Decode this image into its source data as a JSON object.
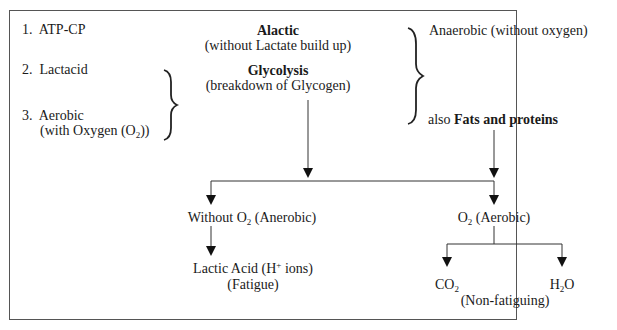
{
  "systems": [
    {
      "number": "1.",
      "label": "ATP-CP"
    },
    {
      "number": "2.",
      "label": "Lactacid"
    },
    {
      "number": "3.",
      "label": "Aerobic",
      "sublabel_prefix": "(with Oxygen (O",
      "sublabel_sub": "2",
      "sublabel_suffix": "))"
    }
  ],
  "center": {
    "alactic_title": "Alactic",
    "alactic_desc": "(without Lactate build up)",
    "glycolysis_title": "Glycolysis",
    "glycolysis_desc": "(breakdown of Glycogen)"
  },
  "right": {
    "anaerobic": "Anaerobic (without oxygen)",
    "also_prefix": "also",
    "fats_proteins": "Fats and proteins"
  },
  "branches": {
    "without_o2_prefix": "Without O",
    "without_o2_sub": "2",
    "without_o2_suffix": " (Anerobic)",
    "o2_prefix": "O",
    "o2_sub": "2",
    "o2_suffix": " (Aerobic)",
    "lactic_prefix": "Lactic Acid (H",
    "lactic_sup": "+",
    "lactic_suffix": " ions)",
    "fatigue": "(Fatigue)",
    "co2_prefix": "CO",
    "co2_sub": "2",
    "h2o_prefix": "H",
    "h2o_sub": "2",
    "h2o_suffix": "O",
    "non_fatiguing": "(Non-fatiguing)"
  }
}
